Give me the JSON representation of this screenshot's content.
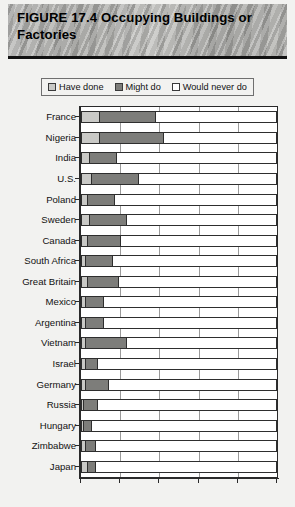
{
  "figure": {
    "title": "FIGURE 17.4  Occupying Buildings or Factories"
  },
  "legend": {
    "items": [
      {
        "label": "Have done",
        "color": "#c9c9c6",
        "key": "have_done"
      },
      {
        "label": "Might do",
        "color": "#7d7d7a",
        "key": "might_do"
      },
      {
        "label": "Would never do",
        "color": "#ffffff",
        "key": "would_never_do"
      }
    ]
  },
  "chart_data": {
    "type": "bar",
    "orientation": "horizontal",
    "stacked": true,
    "percent": true,
    "title": "FIGURE 17.4  Occupying Buildings or Factories",
    "xlabel": "",
    "ylabel": "",
    "xlim": [
      0,
      100
    ],
    "xticks": [
      0,
      20,
      40,
      60,
      80,
      100
    ],
    "grid": true,
    "legend_position": "top",
    "categories": [
      "France",
      "Nigeria",
      "India",
      "U.S.",
      "Poland",
      "Sweden",
      "Canada",
      "South Africa",
      "Great Britain",
      "Mexico",
      "Argentina",
      "Vietnam",
      "Israel",
      "Germany",
      "Russia",
      "Hungary",
      "Zimbabwe",
      "Japan"
    ],
    "series": [
      {
        "name": "Have done",
        "color": "#c9c9c6",
        "values": [
          9,
          9,
          4,
          5,
          3,
          4,
          3,
          2,
          3,
          2,
          2,
          2,
          2,
          2,
          1,
          1,
          2,
          3
        ]
      },
      {
        "name": "Might do",
        "color": "#7d7d7a",
        "values": [
          29,
          33,
          14,
          24,
          14,
          19,
          17,
          14,
          16,
          9,
          9,
          21,
          6,
          12,
          7,
          4,
          5,
          4
        ]
      },
      {
        "name": "Would never do",
        "color": "#ffffff",
        "values": [
          62,
          58,
          82,
          71,
          83,
          77,
          80,
          84,
          81,
          89,
          89,
          77,
          92,
          86,
          92,
          95,
          93,
          93
        ]
      }
    ]
  }
}
